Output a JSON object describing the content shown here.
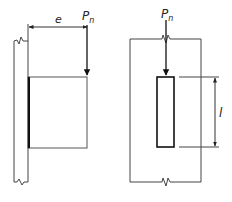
{
  "diagram": {
    "left_figure": {
      "eccentricity_label": "e",
      "load_label_main": "P",
      "load_label_sub": "n"
    },
    "right_figure": {
      "load_label_main": "P",
      "load_label_sub": "n",
      "length_label": "l"
    },
    "colors": {
      "line": "#333333",
      "thick_line": "#111111",
      "background": "#ffffff"
    }
  }
}
